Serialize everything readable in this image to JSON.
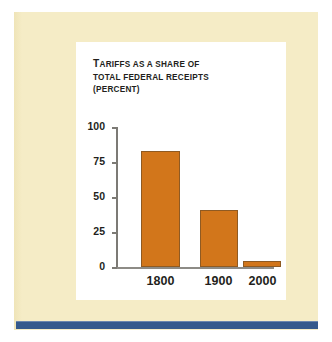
{
  "page": {
    "background_color": "#ffffff",
    "panel_color": "#f5ecc6",
    "rule_color": "#35598c",
    "card_color": "#ffffff"
  },
  "chart_data": {
    "type": "bar",
    "title": "TARIFFS AS A SHARE OF TOTAL FEDERAL RECEIPTS (PERCENT)",
    "title_lines": [
      "TARIFFS AS A SHARE OF",
      "TOTAL FEDERAL RECEIPTS",
      "(PERCENT)"
    ],
    "categories": [
      "1800",
      "1900",
      "2000"
    ],
    "values": [
      83,
      41,
      4
    ],
    "series": [
      {
        "name": "Tariffs as a share of total federal receipts",
        "values": [
          83,
          41,
          4
        ]
      }
    ],
    "xlabel": "",
    "ylabel": "",
    "unit": "percent",
    "ylim": [
      0,
      100
    ],
    "yticks": [
      0,
      25,
      50,
      75,
      100
    ],
    "ytick_labels": [
      "0",
      "25",
      "50",
      "75",
      "100"
    ],
    "grid": false,
    "legend": null,
    "bar_color": "#d2761b",
    "bar_edge_color": "#8f5a22",
    "axis_color": "#7c7a75",
    "text_color": "#231f1c"
  }
}
